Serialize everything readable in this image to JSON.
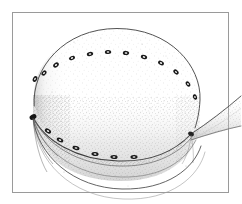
{
  "figure": {
    "title": "Hand-drawn line illustration of a sectioned disc-shaped body",
    "subject_name": "domed-disc-specimen",
    "technique": "pen-and-ink stipple drawing",
    "background_color": "#ffffff",
    "ink_color": "#3a3a3a",
    "stipple_color": "#b9b9b9",
    "marker_color": "#1a1a1a",
    "frame": {
      "name": "plate-border",
      "color": "#9a9a9a",
      "stroke_width": 1,
      "x": 12,
      "y": 12,
      "width": 216,
      "height": 180
    },
    "parts": [
      {
        "id": "top-surface",
        "label": "upper domed surface",
        "description": "large stippled ellipse forming the top face of the disc"
      },
      {
        "id": "body-wall",
        "label": "cylindrical side wall",
        "description": "shaded band below the top surface"
      },
      {
        "id": "inner-rim",
        "label": "inner rim arc",
        "description": "concentric arc inside the lower cavity"
      },
      {
        "id": "lower-arc",
        "label": "outer lower margin",
        "description": "outermost bottom arc crossing the plate border"
      },
      {
        "id": "lateral-flap",
        "label": "lateral wedge flap",
        "description": "tapering wedge projecting to the right past the plate border"
      },
      {
        "id": "marginal-pores",
        "label": "marginal pore ring",
        "description": "ring of small dark ellipses set around the top surface margin"
      },
      {
        "id": "lower-pore-row",
        "label": "lower pore row",
        "description": "row of dark ellipses along the sectioned rim edge"
      }
    ],
    "top_surface": {
      "center_x": 117,
      "center_y": 95,
      "radius_x": 83,
      "radius_y": 67
    },
    "marginal_pores": [
      {
        "x": 35,
        "y": 79,
        "rx": 3.0,
        "ry": 2.1,
        "rot": -62
      },
      {
        "x": 44,
        "y": 73,
        "rx": 3.0,
        "ry": 2.1,
        "rot": -52
      },
      {
        "x": 56,
        "y": 65,
        "rx": 3.1,
        "ry": 2.2,
        "rot": -38
      },
      {
        "x": 72,
        "y": 58,
        "rx": 3.1,
        "ry": 2.0,
        "rot": -24
      },
      {
        "x": 90,
        "y": 54,
        "rx": 3.2,
        "ry": 2.1,
        "rot": -12
      },
      {
        "x": 108,
        "y": 52,
        "rx": 3.2,
        "ry": 2.1,
        "rot": -4
      },
      {
        "x": 126,
        "y": 53,
        "rx": 3.2,
        "ry": 2.1,
        "rot": 6
      },
      {
        "x": 144,
        "y": 57,
        "rx": 3.2,
        "ry": 2.1,
        "rot": 16
      },
      {
        "x": 161,
        "y": 63,
        "rx": 3.1,
        "ry": 2.1,
        "rot": 28
      },
      {
        "x": 176,
        "y": 72,
        "rx": 3.0,
        "ry": 2.1,
        "rot": 42
      },
      {
        "x": 188,
        "y": 84,
        "rx": 2.9,
        "ry": 2.0,
        "rot": 58
      },
      {
        "x": 195,
        "y": 97,
        "rx": 2.8,
        "ry": 2.0,
        "rot": 72
      }
    ],
    "lower_pores": [
      {
        "x": 48,
        "y": 131,
        "rx": 3.4,
        "ry": 2.1,
        "rot": 32
      },
      {
        "x": 60,
        "y": 140,
        "rx": 3.5,
        "ry": 2.0,
        "rot": 24
      },
      {
        "x": 76,
        "y": 148,
        "rx": 3.6,
        "ry": 2.0,
        "rot": 16
      },
      {
        "x": 95,
        "y": 154,
        "rx": 3.6,
        "ry": 2.0,
        "rot": 8
      },
      {
        "x": 114,
        "y": 157,
        "rx": 3.6,
        "ry": 2.0,
        "rot": 2
      },
      {
        "x": 134,
        "y": 157,
        "rx": 3.6,
        "ry": 2.0,
        "rot": -4
      }
    ],
    "node_left": {
      "x": 33,
      "y": 117,
      "label": "left junction node"
    },
    "node_right": {
      "x": 191,
      "y": 134,
      "label": "right junction node"
    }
  }
}
